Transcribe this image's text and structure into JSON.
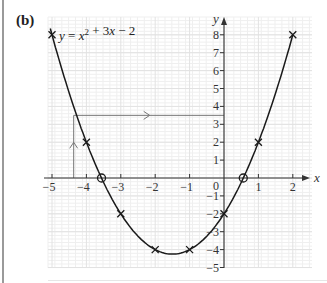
{
  "part_label": "(b)",
  "chart_data": {
    "type": "line",
    "equation": {
      "lhs": "y",
      "rhs_parts": [
        "x",
        "2",
        " + 3",
        "x",
        " − 2"
      ]
    },
    "xlabel": "x",
    "ylabel": "y",
    "xlim": [
      -5,
      2
    ],
    "ylim": [
      -5,
      8
    ],
    "grid": true,
    "x_ticks": [
      -5,
      -4,
      -3,
      -2,
      -1,
      1,
      2
    ],
    "x_tick_labels": [
      "−5",
      "−4",
      "−3",
      "−2",
      "−1",
      "1",
      "2"
    ],
    "y_ticks": [
      8,
      7,
      6,
      5,
      4,
      3,
      2,
      1,
      -1,
      -2,
      -3,
      -4,
      -5
    ],
    "y_tick_labels": [
      "8",
      "7",
      "6",
      "5",
      "4",
      "3",
      "2",
      "1",
      "−1",
      "−2",
      "−3",
      "−4",
      "−5"
    ],
    "origin_label": "0",
    "plotted_points": [
      {
        "x": -5,
        "y": 8
      },
      {
        "x": -4,
        "y": 2
      },
      {
        "x": -3,
        "y": -2
      },
      {
        "x": -2,
        "y": -4
      },
      {
        "x": -1,
        "y": -4
      },
      {
        "x": 0,
        "y": -2
      },
      {
        "x": 1,
        "y": 2
      },
      {
        "x": 2,
        "y": 8
      }
    ],
    "roots_circled": [
      {
        "x": -3.56,
        "y": 0
      },
      {
        "x": 0.56,
        "y": 0
      }
    ],
    "annotation": {
      "description": "Reading x for y = 3.5: vertical arrow up from x ≈ -4.37 to curve, horizontal arrow from curve to y-axis at y = 3.5",
      "y_value": 3.5,
      "x_value": -4.37
    },
    "series": [
      {
        "name": "y = x² + 3x − 2",
        "coefficients": {
          "a": 1,
          "b": 3,
          "c": -2
        }
      }
    ]
  },
  "colors": {
    "curve": "#1a1a1a",
    "axis": "#333333",
    "grid_minor": "#efefef",
    "grid_major": "#e2e2e2",
    "annotation": "#777777"
  }
}
